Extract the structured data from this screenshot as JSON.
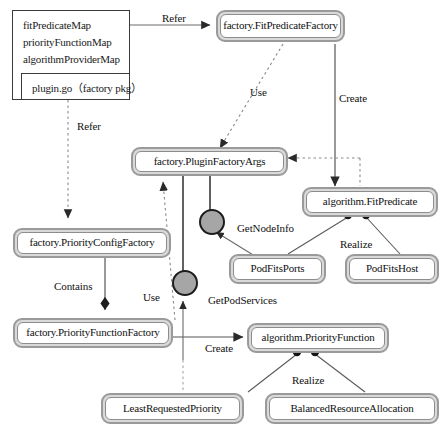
{
  "diagram": {
    "type": "uml-component-diagram",
    "colors": {
      "node_border": "#9a9a9a",
      "node_fill": "#ffffff",
      "node_shadow": "#d9d9d9",
      "ball_fill": "#a6a6a6",
      "line": "#5a5a5a",
      "text": "#111111"
    }
  },
  "package_box": {
    "name": "plugin-go-factory-package",
    "fields": [
      "fitPredicateMap",
      "priorityFunctionMap",
      "algorithmProviderMap"
    ],
    "footer": "plugin.go（factory pkg）"
  },
  "nodes": [
    {
      "id": "fitPredicateFactory",
      "label": "factory.FitPredicateFactory"
    },
    {
      "id": "pluginFactoryArgs",
      "label": "factory.PluginFactoryArgs"
    },
    {
      "id": "fitPredicate",
      "label": "algorithm.FitPredicate"
    },
    {
      "id": "priorityConfigFactory",
      "label": "factory.PriorityConfigFactory"
    },
    {
      "id": "priorityFunctionFactory",
      "label": "factory.PriorityFunctionFactory"
    },
    {
      "id": "podFitsPorts",
      "label": "PodFitsPorts"
    },
    {
      "id": "podFitsHost",
      "label": "PodFitsHost"
    },
    {
      "id": "priorityFunction",
      "label": "algorithm.PriorityFunction"
    },
    {
      "id": "leastRequestedPriority",
      "label": "LeastRequestedPriority"
    },
    {
      "id": "balancedResourceAllocation",
      "label": "BalancedResourceAllocation"
    }
  ],
  "interfaces": [
    {
      "id": "getNodeInfo",
      "label": "GetNodeInfo"
    },
    {
      "id": "getPodServices",
      "label": "GetPodServices"
    }
  ],
  "edges": [
    {
      "id": "refer-top",
      "label": "Refer",
      "from": "plugin-go-factory-package",
      "to": "fitPredicateFactory",
      "style": "solid-arrow"
    },
    {
      "id": "refer-left",
      "label": "Refer",
      "from": "plugin-go-factory-package",
      "to": "priorityConfigFactory",
      "style": "dashed-arrow"
    },
    {
      "id": "use-top",
      "label": "Use",
      "from": "fitPredicateFactory",
      "to": "pluginFactoryArgs",
      "style": "dashed-arrow"
    },
    {
      "id": "create-top",
      "label": "Create",
      "from": "fitPredicateFactory",
      "to": "fitPredicate",
      "style": "solid-arrow"
    },
    {
      "id": "dep-args",
      "label": "",
      "from": "fitPredicate",
      "to": "pluginFactoryArgs",
      "style": "dashed-arrow"
    },
    {
      "id": "contains",
      "label": "Contains",
      "from": "priorityConfigFactory",
      "to": "priorityFunctionFactory",
      "style": "solid-diamond"
    },
    {
      "id": "use-bottom",
      "label": "Use",
      "from": "priorityFunctionFactory",
      "to": "pluginFactoryArgs",
      "style": "dashed-arrow"
    },
    {
      "id": "create-bottom",
      "label": "Create",
      "from": "priorityFunctionFactory",
      "to": "priorityFunction",
      "style": "solid-arrow"
    },
    {
      "id": "realize-fit",
      "label": "Realize",
      "from": "podFitsPorts,podFitsHost",
      "to": "fitPredicate",
      "style": "solid-ball"
    },
    {
      "id": "realize-prio",
      "label": "Realize",
      "from": "leastRequestedPriority,balancedResourceAllocation",
      "to": "priorityFunction",
      "style": "solid-ball"
    }
  ],
  "edge_labels": {
    "refer_top": "Refer",
    "refer_left": "Refer",
    "use_top": "Use",
    "use_bottom": "Use",
    "create_top": "Create",
    "create_bottom": "Create",
    "contains": "Contains",
    "realize_fit": "Realize",
    "realize_prio": "Realize",
    "get_node_info": "GetNodeInfo",
    "get_pod_services": "GetPodServices"
  }
}
